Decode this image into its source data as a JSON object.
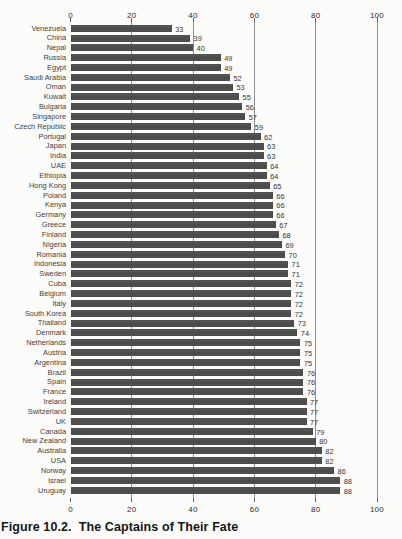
{
  "figure": {
    "caption_prefix": "Figure 10.2.",
    "caption_title": "The Captains of Their Fate"
  },
  "chart_data": {
    "type": "bar",
    "orientation": "horizontal",
    "xlabel": "",
    "ylabel": "",
    "xlim": [
      0,
      100
    ],
    "x_ticks": [
      0,
      20,
      40,
      60,
      80,
      100
    ],
    "grid": true,
    "legend": false,
    "bar_color": "#4e4e4e",
    "value_labels_shown": true,
    "categories": [
      "Venezuela",
      "China",
      "Nepal",
      "Russia",
      "Egypt",
      "Saudi Arabia",
      "Oman",
      "Kuwait",
      "Bulgaria",
      "Singapore",
      "Czech Republic",
      "Portugal",
      "Japan",
      "India",
      "UAE",
      "Ethiopia",
      "Hong Kong",
      "Poland",
      "Kenya",
      "Germany",
      "Greece",
      "Finland",
      "Nigeria",
      "Romania",
      "Indonesia",
      "Sweden",
      "Cuba",
      "Belgium",
      "Italy",
      "South Korea",
      "Thailand",
      "Denmark",
      "Netherlands",
      "Austria",
      "Argentina",
      "Brazil",
      "Spain",
      "France",
      "Ireland",
      "Switzerland",
      "UK",
      "Canada",
      "New Zealand",
      "Australia",
      "USA",
      "Norway",
      "Israel",
      "Uruguay"
    ],
    "values": [
      33,
      39,
      40,
      49,
      49,
      52,
      53,
      55,
      56,
      57,
      59,
      62,
      63,
      63,
      64,
      64,
      65,
      66,
      66,
      66,
      67,
      68,
      69,
      70,
      71,
      71,
      72,
      72,
      72,
      72,
      73,
      74,
      75,
      75,
      75,
      76,
      76,
      76,
      77,
      77,
      77,
      79,
      80,
      82,
      82,
      86,
      88,
      88
    ]
  }
}
